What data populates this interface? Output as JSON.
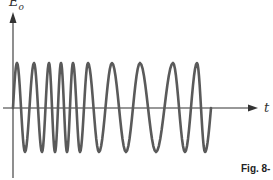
{
  "figure": {
    "y_axis_label": "E",
    "y_axis_label_sub": "o",
    "x_axis_label": "t",
    "caption": "Fig. 8-"
  },
  "waveform": {
    "description": "Frequency-modulated sinusoid: constant amplitude, oscillation frequency decreasing with t (chirp)",
    "start_x": 13,
    "end_x": 211,
    "axis_y": 108,
    "peak_y": 63,
    "trough_y": 152,
    "peaks_x": [
      17,
      34,
      49,
      61,
      73,
      88,
      112,
      140,
      173,
      197
    ],
    "troughs_x": [
      25,
      42,
      55,
      67,
      80,
      99,
      126,
      156,
      185,
      205
    ]
  },
  "colors": {
    "wave": "#5a5a5a",
    "axis": "#333333",
    "background": "#ffffff"
  }
}
